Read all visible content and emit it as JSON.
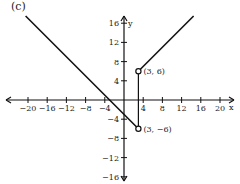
{
  "panel_label": "(c)",
  "chart_data": {
    "type": "line",
    "title": "(c)",
    "xlabel": "x",
    "ylabel": "y",
    "xlim": [
      -22,
      22
    ],
    "ylim": [
      -17,
      17
    ],
    "grid": false,
    "x_ticks": [
      -20,
      -16,
      -12,
      -8,
      -4,
      4,
      8,
      12,
      16,
      20
    ],
    "x_tick_labels": [
      "−20",
      "−16",
      "−12",
      "−8",
      "−4",
      "4",
      "8",
      "12",
      "16",
      "20"
    ],
    "y_ticks": [
      16,
      12,
      8,
      4,
      -4,
      -8,
      -12,
      -16
    ],
    "y_tick_labels": [
      "16",
      "12",
      "8",
      "4",
      "−4",
      "−8",
      "−12",
      "−16"
    ],
    "series": [
      {
        "name": "left piece",
        "equation": "y = -x - 3",
        "x": [
          -20.5,
          3
        ],
        "y": [
          17.5,
          -6
        ],
        "endpoint": "open circle at (3, -6)"
      },
      {
        "name": "right piece",
        "equation": "y = x + 3",
        "x": [
          3,
          14.5
        ],
        "y": [
          6,
          17.5
        ],
        "endpoint": "open circle at (3, 6)"
      }
    ],
    "annotations": [
      {
        "text": "(3, 6)",
        "x": 3,
        "y": 6
      },
      {
        "text": "(3, −6)",
        "x": 3,
        "y": -6
      }
    ]
  }
}
